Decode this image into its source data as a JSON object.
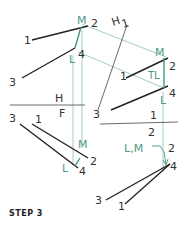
{
  "caption": "STEP 3",
  "colors": {
    "object_line": "#222222",
    "projection_line": "#8fbfb2",
    "true_length_line": "#3f9a7a",
    "label_black": "#333333",
    "label_green": "#4e9a86",
    "folding_line": "#444444"
  },
  "folding_lines": {
    "hf": {
      "top": "H",
      "bottom": "F"
    },
    "h1": {
      "left": "H",
      "right": "1"
    },
    "one_two": {
      "top": "1",
      "bottom": "2"
    }
  },
  "views": {
    "top_view": {
      "points": {
        "m": "M",
        "two": "2",
        "one": "1",
        "l": "L",
        "four": "4",
        "three": "3"
      }
    },
    "auxiliary_view_1": {
      "points": {
        "m": "M",
        "two": "2",
        "one": "1",
        "tl": "TL",
        "four": "4",
        "l": "L"
      }
    },
    "front_view": {
      "points": {
        "three": "3",
        "one": "1",
        "m": "M",
        "two": "2",
        "l": "L",
        "four": "4"
      }
    },
    "auxiliary_view_2": {
      "points": {
        "three": "3",
        "lm": "L,M",
        "two": "2",
        "four": "4",
        "one": "1"
      }
    }
  }
}
